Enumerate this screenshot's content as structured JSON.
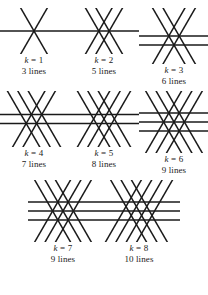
{
  "figure": {
    "stroke_color": "#1a1a1a",
    "background_color": "#ffffff",
    "stroke_width": 1.5,
    "rows": [
      {
        "row_index": 1,
        "cells": [
          {
            "k_label": "k = 1",
            "k_symbol": "k",
            "k_equals": " = ",
            "k_value": "1",
            "lines_label": "3 lines",
            "lines_count": 3,
            "art_width": 70,
            "art_height": 46,
            "lines": [
              {
                "angle": 0,
                "offset": 0
              },
              {
                "angle": 60,
                "offset": 0
              },
              {
                "angle": 120,
                "offset": 0
              }
            ]
          },
          {
            "k_label": "k = 2",
            "k_symbol": "k",
            "k_equals": " = ",
            "k_value": "2",
            "lines_label": "5 lines",
            "lines_count": 5,
            "art_width": 70,
            "art_height": 46,
            "lines": [
              {
                "angle": 0,
                "offset": 0
              },
              {
                "angle": 60,
                "offset": -1
              },
              {
                "angle": 60,
                "offset": 1
              },
              {
                "angle": 120,
                "offset": -1
              },
              {
                "angle": 120,
                "offset": 1
              }
            ]
          },
          {
            "k_label": "k = 3",
            "k_symbol": "k",
            "k_equals": " = ",
            "k_value": "3",
            "lines_label": "6 lines",
            "lines_count": 6,
            "art_width": 70,
            "art_height": 56,
            "lines": [
              {
                "angle": 0,
                "offset": 0
              },
              {
                "angle": 0,
                "offset": 2
              },
              {
                "angle": 60,
                "offset": -1
              },
              {
                "angle": 60,
                "offset": 1
              },
              {
                "angle": 120,
                "offset": -1
              },
              {
                "angle": 120,
                "offset": 1
              }
            ]
          }
        ]
      },
      {
        "row_index": 2,
        "cells": [
          {
            "k_label": "k = 4",
            "k_symbol": "k",
            "k_equals": " = ",
            "k_value": "4",
            "lines_label": "7 lines",
            "lines_count": 7,
            "art_width": 70,
            "art_height": 56,
            "lines": [
              {
                "angle": 0,
                "offset": -1
              },
              {
                "angle": 0,
                "offset": 1
              },
              {
                "angle": 60,
                "offset": -1
              },
              {
                "angle": 60,
                "offset": 1
              },
              {
                "angle": 120,
                "offset": -2
              },
              {
                "angle": 120,
                "offset": 0
              },
              {
                "angle": 120,
                "offset": 2
              }
            ]
          },
          {
            "k_label": "k = 5",
            "k_symbol": "k",
            "k_equals": " = ",
            "k_value": "5",
            "lines_label": "8 lines",
            "lines_count": 8,
            "art_width": 70,
            "art_height": 56,
            "lines": [
              {
                "angle": 0,
                "offset": -1
              },
              {
                "angle": 0,
                "offset": 1
              },
              {
                "angle": 60,
                "offset": -2
              },
              {
                "angle": 60,
                "offset": 0
              },
              {
                "angle": 60,
                "offset": 2
              },
              {
                "angle": 120,
                "offset": -2
              },
              {
                "angle": 120,
                "offset": 0
              },
              {
                "angle": 120,
                "offset": 2
              }
            ]
          },
          {
            "k_label": "k = 6",
            "k_symbol": "k",
            "k_equals": " = ",
            "k_value": "6",
            "lines_label": "9 lines",
            "lines_count": 9,
            "art_width": 70,
            "art_height": 62,
            "lines": [
              {
                "angle": 0,
                "offset": -2
              },
              {
                "angle": 0,
                "offset": 0
              },
              {
                "angle": 0,
                "offset": 2
              },
              {
                "angle": 60,
                "offset": -2
              },
              {
                "angle": 60,
                "offset": 0
              },
              {
                "angle": 60,
                "offset": 2
              },
              {
                "angle": 120,
                "offset": -2
              },
              {
                "angle": 120,
                "offset": 0
              },
              {
                "angle": 120,
                "offset": 2
              }
            ]
          }
        ]
      },
      {
        "row_index": 3,
        "cells": [
          {
            "k_label": "k = 7",
            "k_symbol": "k",
            "k_equals": " = ",
            "k_value": "7",
            "lines_label": "9 lines",
            "lines_count": 9,
            "art_width": 70,
            "art_height": 62,
            "lines": [
              {
                "angle": 0,
                "offset": -2
              },
              {
                "angle": 0,
                "offset": 0
              },
              {
                "angle": 0,
                "offset": 2
              },
              {
                "angle": 60,
                "offset": -2
              },
              {
                "angle": 60,
                "offset": 0
              },
              {
                "angle": 60,
                "offset": 2
              },
              {
                "angle": 120,
                "offset": -2
              },
              {
                "angle": 120,
                "offset": 0
              },
              {
                "angle": 120,
                "offset": 2
              }
            ]
          },
          {
            "k_label": "k = 8",
            "k_symbol": "k",
            "k_equals": " = ",
            "k_value": "8",
            "lines_label": "10 lines",
            "lines_count": 10,
            "art_width": 82,
            "art_height": 62,
            "lines": [
              {
                "angle": 0,
                "offset": -2
              },
              {
                "angle": 0,
                "offset": 0
              },
              {
                "angle": 0,
                "offset": 2
              },
              {
                "angle": 60,
                "offset": -3
              },
              {
                "angle": 60,
                "offset": -1
              },
              {
                "angle": 60,
                "offset": 1
              },
              {
                "angle": 60,
                "offset": 3
              },
              {
                "angle": 120,
                "offset": -2
              },
              {
                "angle": 120,
                "offset": 0
              },
              {
                "angle": 120,
                "offset": 2
              }
            ]
          }
        ]
      }
    ]
  }
}
